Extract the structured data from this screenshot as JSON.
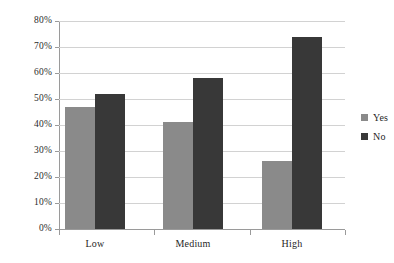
{
  "chart_data": {
    "type": "bar",
    "title": "",
    "xlabel": "",
    "ylabel": "",
    "categories": [
      "Low",
      "Medium",
      "High"
    ],
    "series": [
      {
        "name": "Yes",
        "color": "#8a8a8a",
        "values": [
          47,
          41,
          26
        ]
      },
      {
        "name": "No",
        "color": "#383838",
        "values": [
          52,
          58,
          74
        ]
      }
    ],
    "ylim": [
      0,
      80
    ],
    "ytick_step": 10,
    "ytick_labels": [
      "0%",
      "10%",
      "20%",
      "30%",
      "40%",
      "50%",
      "60%",
      "70%",
      "80%"
    ],
    "ytick_values": [
      0,
      10,
      20,
      30,
      40,
      50,
      60,
      70,
      80
    ],
    "grid": true,
    "legend_position": "right",
    "value_format": "percent"
  },
  "axis": {
    "y_labels": [
      "80%",
      "70%",
      "60%",
      "50%",
      "40%",
      "30%",
      "20%",
      "10%",
      "0%"
    ],
    "x_labels": [
      "Low",
      "Medium",
      "High"
    ]
  },
  "legend": {
    "items": [
      {
        "label": "Yes",
        "color": "#8a8a8a"
      },
      {
        "label": "No",
        "color": "#383838"
      }
    ]
  }
}
